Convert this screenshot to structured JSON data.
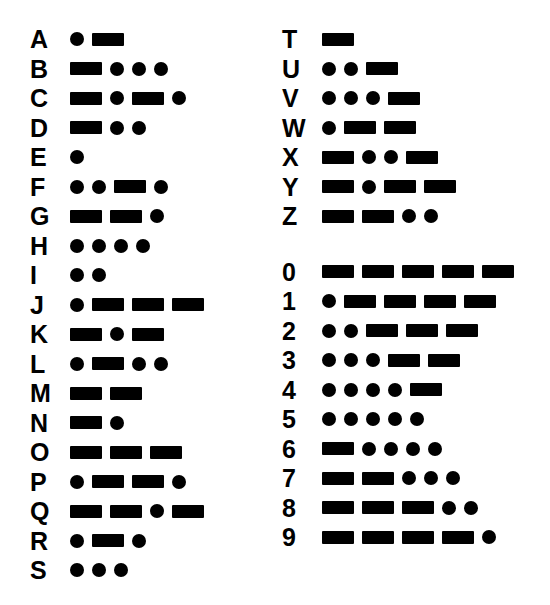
{
  "colors": {
    "background": "#ffffff",
    "ink": "#000000"
  },
  "legend": {
    "dot_name": "dot-symbol",
    "dash_name": "dash-symbol",
    "dot_char": "·",
    "dash_char": "−"
  },
  "layout": {
    "columns": 2,
    "row_height": 29.5,
    "left_column_top": 28,
    "right_column_top": 28,
    "digit_group_gap": 26
  },
  "columns": [
    {
      "name": "letters-a-to-s",
      "groups": [
        {
          "name": "letters-group",
          "rows": [
            {
              "label": "A",
              "code": ".-",
              "symbols": [
                "dot",
                "dash"
              ]
            },
            {
              "label": "B",
              "code": "-...",
              "symbols": [
                "dash",
                "dot",
                "dot",
                "dot"
              ]
            },
            {
              "label": "C",
              "code": "-.-.",
              "symbols": [
                "dash",
                "dot",
                "dash",
                "dot"
              ]
            },
            {
              "label": "D",
              "code": "-..",
              "symbols": [
                "dash",
                "dot",
                "dot"
              ]
            },
            {
              "label": "E",
              "code": ".",
              "symbols": [
                "dot"
              ]
            },
            {
              "label": "F",
              "code": "..-.",
              "symbols": [
                "dot",
                "dot",
                "dash",
                "dot"
              ]
            },
            {
              "label": "G",
              "code": "--.",
              "symbols": [
                "dash",
                "dash",
                "dot"
              ]
            },
            {
              "label": "H",
              "code": "....",
              "symbols": [
                "dot",
                "dot",
                "dot",
                "dot"
              ]
            },
            {
              "label": "I",
              "code": "..",
              "symbols": [
                "dot",
                "dot"
              ]
            },
            {
              "label": "J",
              "code": ".---",
              "symbols": [
                "dot",
                "dash",
                "dash",
                "dash"
              ]
            },
            {
              "label": "K",
              "code": "-.-",
              "symbols": [
                "dash",
                "dot",
                "dash"
              ]
            },
            {
              "label": "L",
              "code": ".-..",
              "symbols": [
                "dot",
                "dash",
                "dot",
                "dot"
              ]
            },
            {
              "label": "M",
              "code": "--",
              "symbols": [
                "dash",
                "dash"
              ]
            },
            {
              "label": "N",
              "code": "-.",
              "symbols": [
                "dash",
                "dot"
              ]
            },
            {
              "label": "O",
              "code": "---",
              "symbols": [
                "dash",
                "dash",
                "dash"
              ]
            },
            {
              "label": "P",
              "code": ".--.",
              "symbols": [
                "dot",
                "dash",
                "dash",
                "dot"
              ]
            },
            {
              "label": "Q",
              "code": "--.-",
              "symbols": [
                "dash",
                "dash",
                "dot",
                "dash"
              ]
            },
            {
              "label": "R",
              "code": ".-.",
              "symbols": [
                "dot",
                "dash",
                "dot"
              ]
            },
            {
              "label": "S",
              "code": "...",
              "symbols": [
                "dot",
                "dot",
                "dot"
              ]
            }
          ]
        }
      ]
    },
    {
      "name": "letters-t-to-z-and-digits",
      "groups": [
        {
          "name": "letters-group",
          "rows": [
            {
              "label": "T",
              "code": "-",
              "symbols": [
                "dash"
              ]
            },
            {
              "label": "U",
              "code": "..-",
              "symbols": [
                "dot",
                "dot",
                "dash"
              ]
            },
            {
              "label": "V",
              "code": "...-",
              "symbols": [
                "dot",
                "dot",
                "dot",
                "dash"
              ]
            },
            {
              "label": "W",
              "code": ".--",
              "symbols": [
                "dot",
                "dash",
                "dash"
              ]
            },
            {
              "label": "X",
              "code": "-..-",
              "symbols": [
                "dash",
                "dot",
                "dot",
                "dash"
              ]
            },
            {
              "label": "Y",
              "code": "-.--",
              "symbols": [
                "dash",
                "dot",
                "dash",
                "dash"
              ]
            },
            {
              "label": "Z",
              "code": "--..",
              "symbols": [
                "dash",
                "dash",
                "dot",
                "dot"
              ]
            }
          ]
        },
        {
          "name": "digits-group",
          "rows": [
            {
              "label": "0",
              "code": "-----",
              "symbols": [
                "dash",
                "dash",
                "dash",
                "dash",
                "dash"
              ]
            },
            {
              "label": "1",
              "code": ".----",
              "symbols": [
                "dot",
                "dash",
                "dash",
                "dash",
                "dash"
              ]
            },
            {
              "label": "2",
              "code": "..---",
              "symbols": [
                "dot",
                "dot",
                "dash",
                "dash",
                "dash"
              ]
            },
            {
              "label": "3",
              "code": "...--",
              "symbols": [
                "dot",
                "dot",
                "dot",
                "dash",
                "dash"
              ]
            },
            {
              "label": "4",
              "code": "....-",
              "symbols": [
                "dot",
                "dot",
                "dot",
                "dot",
                "dash"
              ]
            },
            {
              "label": "5",
              "code": ".....",
              "symbols": [
                "dot",
                "dot",
                "dot",
                "dot",
                "dot"
              ]
            },
            {
              "label": "6",
              "code": "-....",
              "symbols": [
                "dash",
                "dot",
                "dot",
                "dot",
                "dot"
              ]
            },
            {
              "label": "7",
              "code": "--...",
              "symbols": [
                "dash",
                "dash",
                "dot",
                "dot",
                "dot"
              ]
            },
            {
              "label": "8",
              "code": "---..",
              "symbols": [
                "dash",
                "dash",
                "dash",
                "dot",
                "dot"
              ]
            },
            {
              "label": "9",
              "code": "----.",
              "symbols": [
                "dash",
                "dash",
                "dash",
                "dash",
                "dot"
              ]
            }
          ]
        }
      ]
    }
  ]
}
